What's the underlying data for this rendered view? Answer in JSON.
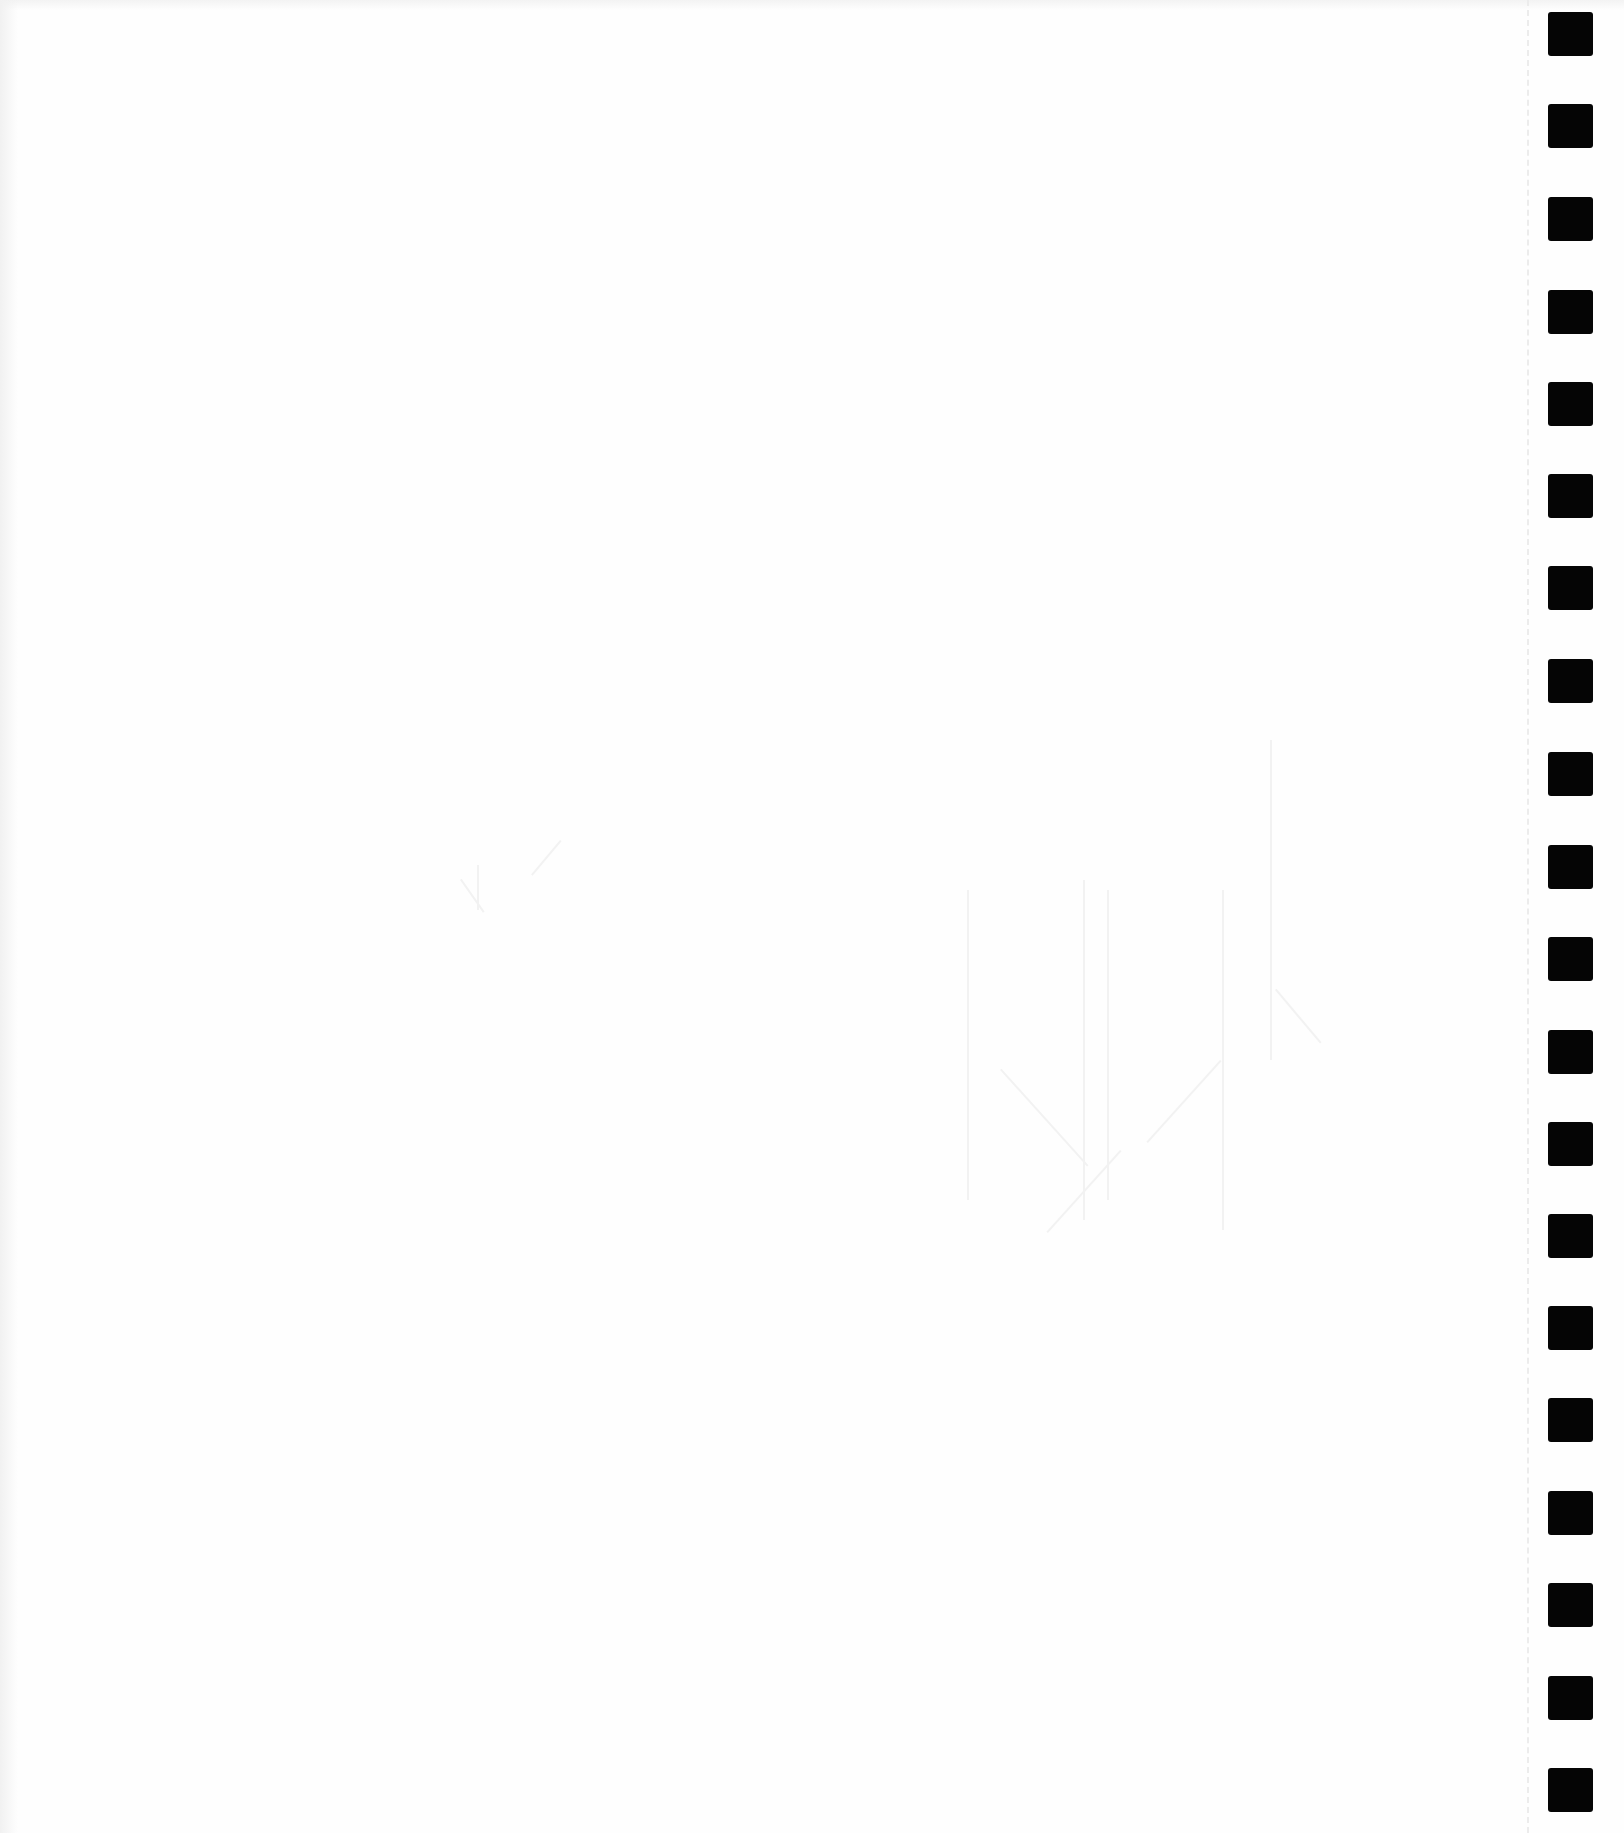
{
  "page": {
    "type": "scanned-blank-form-page",
    "background_color": "#fefefe",
    "content_text": ""
  },
  "timing_marks": {
    "count": 20,
    "color": "#050505",
    "x": 1548,
    "width": 45,
    "height": 44,
    "positions_y": [
      12,
      104,
      197,
      290,
      382,
      474,
      566,
      659,
      752,
      845,
      937,
      1030,
      1122,
      1214,
      1306,
      1398,
      1491,
      1583,
      1676,
      1768
    ]
  },
  "perforation_line": {
    "x": 1527,
    "style": "dashed",
    "color": "#ececec"
  }
}
